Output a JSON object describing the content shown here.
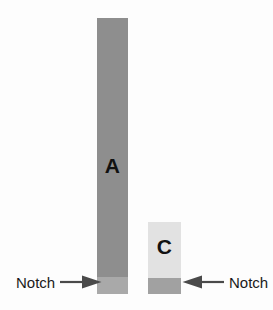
{
  "figure": {
    "background_color": "#fdfdfd",
    "width": 273,
    "height": 310
  },
  "specimens": [
    {
      "id": "a",
      "letter": "A",
      "body_color": "#8e8e8e",
      "notch_color": "#a9a9a9",
      "notch_name": "notch"
    },
    {
      "id": "c",
      "letter": "C",
      "body_color": "#e2e2e2",
      "notch_color": "#a1a1a1",
      "notch_name": "notch"
    }
  ],
  "callouts": [
    {
      "id": "left",
      "label": "Notch",
      "arrow_direction": "right",
      "arrow_color": "#4a4a4a",
      "target": "A"
    },
    {
      "id": "right",
      "label": "Notch",
      "arrow_direction": "left",
      "arrow_color": "#4a4a4a",
      "target": "C"
    }
  ]
}
